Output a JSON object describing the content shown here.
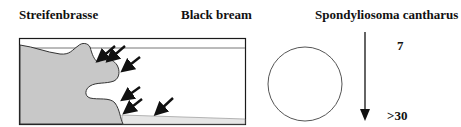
{
  "labels": {
    "german_name": "Streifenbrasse",
    "english_name": "Black bream",
    "scientific_name": "Spondyliosoma cantharus"
  },
  "scale": {
    "top_value": "7",
    "bottom_value": ">30"
  },
  "icons": {
    "habitat": "rocky-reef-cross-section-with-arrows",
    "shape": "circle-outline",
    "direction": "down-arrow"
  },
  "colors": {
    "rock_fill": "#c8c8c8",
    "line": "#1a1a1a",
    "water_line": "#777777",
    "sand_fill": "#e6e6e6"
  }
}
